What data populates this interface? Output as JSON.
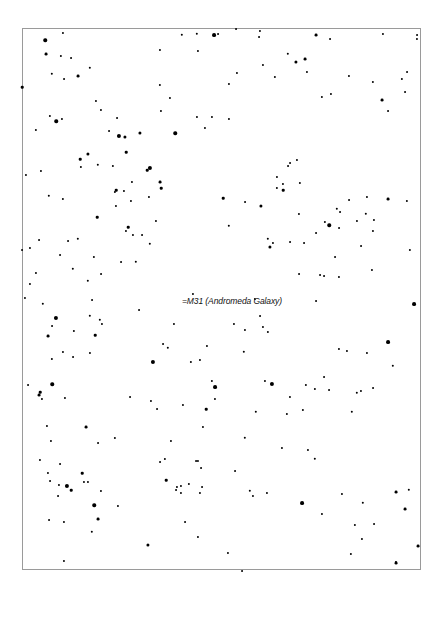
{
  "chart": {
    "title": "",
    "frame": {
      "left": 22,
      "top": 28,
      "right": 421,
      "bottom": 570,
      "border_color": "#9a9a9a"
    },
    "background": "#ffffff",
    "star_color": "#000000"
  },
  "annotations": [
    {
      "label": "=M31 (Andromeda Galaxy)",
      "x": 182,
      "y": 296
    }
  ],
  "stars": [
    [
      22,
      87,
      1.6
    ],
    [
      45,
      40,
      2.2
    ],
    [
      46,
      54,
      1.8
    ],
    [
      63,
      33,
      1.3
    ],
    [
      61,
      56,
      1.4
    ],
    [
      71,
      58,
      1.2
    ],
    [
      52,
      74,
      1.5
    ],
    [
      64,
      79,
      1.2
    ],
    [
      78,
      76,
      1.8
    ],
    [
      90,
      68,
      1.5
    ],
    [
      96,
      101,
      1.3
    ],
    [
      101,
      110,
      1.3
    ],
    [
      117,
      118,
      1.2
    ],
    [
      119,
      136,
      2.6
    ],
    [
      88,
      154,
      2.0
    ],
    [
      56,
      121,
      2.2
    ],
    [
      50,
      116,
      1.4
    ],
    [
      62,
      119,
      1.3
    ],
    [
      109,
      131,
      1.2
    ],
    [
      125,
      137,
      2.0
    ],
    [
      126,
      152,
      1.6
    ],
    [
      140,
      133,
      2.0
    ],
    [
      160,
      50,
      1.3
    ],
    [
      160,
      85,
      1.4
    ],
    [
      170,
      98,
      1.3
    ],
    [
      161,
      111,
      1.3
    ],
    [
      175,
      133,
      2.2
    ],
    [
      182,
      35,
      1.5
    ],
    [
      197,
      34,
      1.5
    ],
    [
      198,
      51,
      1.3
    ],
    [
      214,
      35,
      2.4
    ],
    [
      229,
      84,
      1.3
    ],
    [
      197,
      117,
      1.3
    ],
    [
      205,
      128,
      1.3
    ],
    [
      212,
      117,
      1.3
    ],
    [
      150,
      168,
      2.6
    ],
    [
      147,
      170,
      1.6
    ],
    [
      160,
      182,
      1.8
    ],
    [
      161,
      188,
      1.6
    ],
    [
      218,
      34,
      1.2
    ],
    [
      236,
      29,
      1.2
    ],
    [
      260,
      31,
      1.3
    ],
    [
      259,
      37,
      1.2
    ],
    [
      237,
      73,
      1.3
    ],
    [
      229,
      119,
      1.3
    ],
    [
      263,
      65,
      1.3
    ],
    [
      275,
      77,
      1.4
    ],
    [
      288,
      54,
      1.5
    ],
    [
      296,
      62,
      2.0
    ],
    [
      305,
      59,
      1.8
    ],
    [
      307,
      72,
      1.3
    ],
    [
      316,
      35,
      1.8
    ],
    [
      330,
      39,
      1.2
    ],
    [
      322,
      97,
      1.4
    ],
    [
      331,
      94,
      1.3
    ],
    [
      349,
      76,
      1.3
    ],
    [
      373,
      82,
      1.4
    ],
    [
      382,
      100,
      1.8
    ],
    [
      388,
      111,
      1.2
    ],
    [
      383,
      34,
      1.3
    ],
    [
      417,
      35,
      1.2
    ],
    [
      417,
      39,
      1.3
    ],
    [
      405,
      92,
      1.2
    ],
    [
      402,
      79,
      1.4
    ],
    [
      407,
      72,
      1.2
    ],
    [
      410,
      250,
      1.4
    ],
    [
      414,
      304,
      2.4
    ],
    [
      36,
      130,
      1.4
    ],
    [
      26,
      175,
      1.3
    ],
    [
      41,
      171,
      1.3
    ],
    [
      49,
      196,
      1.5
    ],
    [
      63,
      199,
      1.4
    ],
    [
      80,
      159,
      1.6
    ],
    [
      81,
      167,
      1.4
    ],
    [
      98,
      165,
      1.5
    ],
    [
      113,
      166,
      1.4
    ],
    [
      116,
      190,
      1.6
    ],
    [
      115,
      192,
      1.4
    ],
    [
      124,
      191,
      1.3
    ],
    [
      132,
      182,
      1.3
    ],
    [
      131,
      201,
      1.3
    ],
    [
      116,
      206,
      1.3
    ],
    [
      128,
      227,
      1.6
    ],
    [
      126,
      231,
      1.3
    ],
    [
      133,
      235,
      1.3
    ],
    [
      142,
      235,
      1.2
    ],
    [
      149,
      197,
      1.3
    ],
    [
      156,
      221,
      1.3
    ],
    [
      150,
      244,
      1.5
    ],
    [
      136,
      262,
      1.5
    ],
    [
      121,
      262,
      1.2
    ],
    [
      97,
      217,
      1.6
    ],
    [
      88,
      281,
      1.5
    ],
    [
      94,
      257,
      1.4
    ],
    [
      101,
      274,
      1.2
    ],
    [
      78,
      239,
      1.5
    ],
    [
      73,
      269,
      1.5
    ],
    [
      68,
      241,
      1.2
    ],
    [
      60,
      255,
      1.2
    ],
    [
      39,
      240,
      1.2
    ],
    [
      30,
      248,
      1.3
    ],
    [
      36,
      273,
      1.3
    ],
    [
      22,
      250,
      1.2
    ],
    [
      25,
      298,
      1.3
    ],
    [
      30,
      284,
      1.3
    ],
    [
      43,
      304,
      1.5
    ],
    [
      56,
      318,
      2.6
    ],
    [
      52,
      326,
      1.2
    ],
    [
      48,
      336,
      1.8
    ],
    [
      74,
      331,
      1.4
    ],
    [
      95,
      335,
      1.6
    ],
    [
      100,
      320,
      1.5
    ],
    [
      90,
      316,
      1.5
    ],
    [
      92,
      300,
      1.2
    ],
    [
      102,
      324,
      1.3
    ],
    [
      139,
      310,
      1.2
    ],
    [
      168,
      348,
      1.5
    ],
    [
      163,
      344,
      1.2
    ],
    [
      174,
      324,
      1.3
    ],
    [
      191,
      362,
      1.4
    ],
    [
      193,
      294,
      1.3
    ],
    [
      200,
      360,
      1.3
    ],
    [
      207,
      346,
      1.3
    ],
    [
      212,
      381,
      1.4
    ],
    [
      244,
      352,
      1.5
    ],
    [
      245,
      330,
      1.3
    ],
    [
      260,
      316,
      1.2
    ],
    [
      234,
      324,
      1.3
    ],
    [
      263,
      327,
      1.3
    ],
    [
      268,
      332,
      1.4
    ],
    [
      265,
      381,
      1.3
    ],
    [
      223,
      198,
      1.6
    ],
    [
      283,
      190,
      1.6
    ],
    [
      299,
      214,
      1.3
    ],
    [
      255,
      299,
      1.4
    ],
    [
      261,
      206,
      2.0
    ],
    [
      229,
      226,
      1.5
    ],
    [
      245,
      202,
      1.2
    ],
    [
      268,
      239,
      1.5
    ],
    [
      270,
      247,
      2.0
    ],
    [
      273,
      243,
      1.3
    ],
    [
      290,
      242,
      1.2
    ],
    [
      304,
      243,
      1.2
    ],
    [
      290,
      163,
      1.2
    ],
    [
      288,
      166,
      1.2
    ],
    [
      277,
      177,
      1.3
    ],
    [
      277,
      188,
      1.4
    ],
    [
      283,
      184,
      1.3
    ],
    [
      297,
      160,
      1.3
    ],
    [
      300,
      183,
      1.4
    ],
    [
      316,
      233,
      1.2
    ],
    [
      329,
      225,
      2.2
    ],
    [
      325,
      222,
      1.4
    ],
    [
      339,
      228,
      1.2
    ],
    [
      337,
      209,
      1.5
    ],
    [
      340,
      212,
      1.2
    ],
    [
      349,
      200,
      1.2
    ],
    [
      357,
      221,
      1.3
    ],
    [
      366,
      214,
      1.5
    ],
    [
      367,
      197,
      1.3
    ],
    [
      374,
      220,
      1.3
    ],
    [
      373,
      231,
      1.3
    ],
    [
      361,
      246,
      1.2
    ],
    [
      372,
      270,
      1.3
    ],
    [
      388,
      199,
      1.8
    ],
    [
      407,
      201,
      1.4
    ],
    [
      335,
      257,
      1.2
    ],
    [
      339,
      277,
      1.3
    ],
    [
      320,
      275,
      1.2
    ],
    [
      324,
      276,
      1.2
    ],
    [
      299,
      274,
      1.2
    ],
    [
      316,
      301,
      1.2
    ],
    [
      347,
      351,
      1.3
    ],
    [
      367,
      353,
      1.3
    ],
    [
      388,
      342,
      2.4
    ],
    [
      393,
      366,
      1.5
    ],
    [
      373,
      388,
      1.2
    ],
    [
      357,
      393,
      1.5
    ],
    [
      352,
      412,
      1.5
    ],
    [
      361,
      391,
      1.3
    ],
    [
      272,
      384,
      2.6
    ],
    [
      290,
      397,
      1.3
    ],
    [
      303,
      410,
      1.4
    ],
    [
      315,
      389,
      1.4
    ],
    [
      329,
      390,
      1.2
    ],
    [
      339,
      349,
      1.3
    ],
    [
      324,
      377,
      1.2
    ],
    [
      282,
      448,
      1.3
    ],
    [
      315,
      459,
      1.5
    ],
    [
      306,
      385,
      1.4
    ],
    [
      245,
      438,
      1.5
    ],
    [
      256,
      412,
      1.5
    ],
    [
      287,
      414,
      1.4
    ],
    [
      308,
      450,
      1.3
    ],
    [
      235,
      471,
      1.2
    ],
    [
      250,
      491,
      1.5
    ],
    [
      267,
      493,
      1.3
    ],
    [
      302,
      503,
      2.4
    ],
    [
      322,
      514,
      1.3
    ],
    [
      342,
      494,
      1.3
    ],
    [
      355,
      525,
      1.4
    ],
    [
      363,
      503,
      1.5
    ],
    [
      374,
      524,
      1.2
    ],
    [
      362,
      539,
      1.3
    ],
    [
      351,
      554,
      1.4
    ],
    [
      396,
      492,
      1.8
    ],
    [
      409,
      490,
      1.5
    ],
    [
      405,
      509,
      1.8
    ],
    [
      418,
      546,
      1.8
    ],
    [
      396,
      563,
      1.8
    ],
    [
      396,
      562,
      1.3
    ],
    [
      242,
      571,
      1.2
    ],
    [
      228,
      553,
      1.3
    ],
    [
      196,
      461,
      1.2
    ],
    [
      215,
      387,
      2.4
    ],
    [
      215,
      399,
      1.3
    ],
    [
      206,
      409,
      1.6
    ],
    [
      183,
      405,
      1.3
    ],
    [
      203,
      427,
      1.3
    ],
    [
      171,
      441,
      1.3
    ],
    [
      165,
      459,
      1.4
    ],
    [
      166,
      480,
      1.6
    ],
    [
      181,
      493,
      1.3
    ],
    [
      181,
      486,
      1.3
    ],
    [
      189,
      484,
      1.4
    ],
    [
      176,
      490,
      1.2
    ],
    [
      198,
      461,
      1.3
    ],
    [
      201,
      468,
      1.2
    ],
    [
      160,
      462,
      1.2
    ],
    [
      153,
      362,
      2.6
    ],
    [
      151,
      401,
      1.3
    ],
    [
      157,
      409,
      1.2
    ],
    [
      130,
      397,
      1.2
    ],
    [
      115,
      438,
      1.4
    ],
    [
      98,
      443,
      1.2
    ],
    [
      90,
      353,
      1.3
    ],
    [
      86,
      427,
      1.8
    ],
    [
      73,
      357,
      1.2
    ],
    [
      63,
      352,
      1.3
    ],
    [
      52,
      359,
      1.4
    ],
    [
      52,
      384,
      2.2
    ],
    [
      40,
      392,
      1.6
    ],
    [
      39,
      395,
      1.8
    ],
    [
      42,
      399,
      1.3
    ],
    [
      65,
      398,
      1.3
    ],
    [
      47,
      426,
      1.3
    ],
    [
      51,
      441,
      1.3
    ],
    [
      28,
      385,
      1.2
    ],
    [
      40,
      460,
      1.3
    ],
    [
      48,
      473,
      1.3
    ],
    [
      50,
      481,
      1.2
    ],
    [
      59,
      485,
      1.3
    ],
    [
      60,
      464,
      1.2
    ],
    [
      67,
      486,
      2.6
    ],
    [
      71,
      490,
      1.6
    ],
    [
      58,
      496,
      1.2
    ],
    [
      94,
      505,
      2.2
    ],
    [
      98,
      519,
      1.8
    ],
    [
      92,
      532,
      1.5
    ],
    [
      82,
      473,
      1.6
    ],
    [
      84,
      482,
      1.3
    ],
    [
      88,
      482,
      1.3
    ],
    [
      101,
      491,
      1.3
    ],
    [
      49,
      520,
      1.2
    ],
    [
      64,
      522,
      1.3
    ],
    [
      64,
      561,
      1.3
    ],
    [
      118,
      506,
      1.3
    ],
    [
      148,
      545,
      2.0
    ],
    [
      202,
      487,
      1.2
    ],
    [
      198,
      537,
      1.3
    ],
    [
      253,
      496,
      1.3
    ],
    [
      200,
      493,
      1.3
    ],
    [
      177,
      487,
      1.3
    ],
    [
      185,
      522,
      1.2
    ]
  ]
}
